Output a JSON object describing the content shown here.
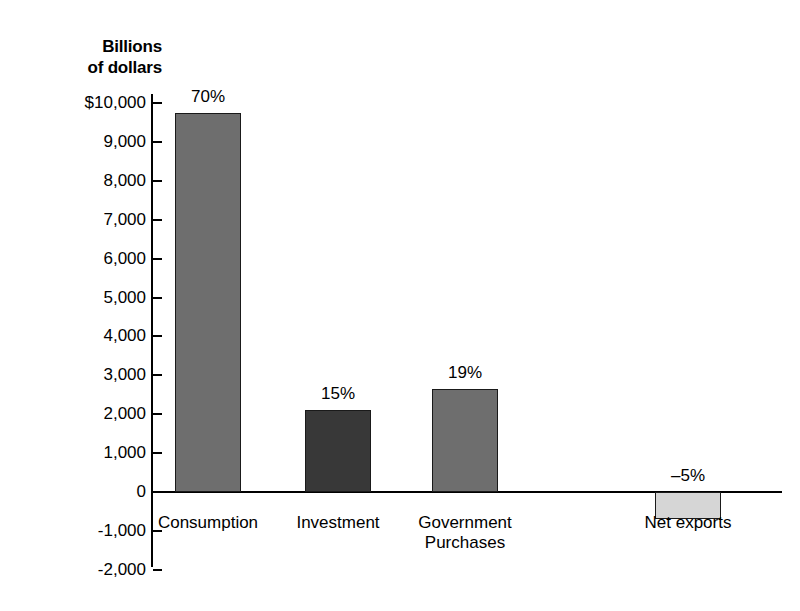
{
  "chart_data": {
    "type": "bar",
    "title": "",
    "subtitle": "",
    "axis_title": "Billions\nof dollars",
    "xlabel": "",
    "ylabel": "Billions of dollars",
    "ylim": [
      -2000,
      10000
    ],
    "ytick_step": 1000,
    "grid": false,
    "legend": "none",
    "categories": [
      "Consumption",
      "Investment",
      "Government\nPurchases",
      "Net exports"
    ],
    "values": [
      9750,
      2100,
      2650,
      -700
    ],
    "data_labels": [
      "70%",
      "15%",
      "19%",
      "–5%"
    ],
    "bar_colors": [
      "#6e6e6e",
      "#383838",
      "#6e6e6e",
      "#d6d6d6"
    ],
    "ytick_labels": [
      "$10,000",
      "9,000",
      "8,000",
      "7,000",
      "6,000",
      "5,000",
      "4,000",
      "3,000",
      "2,000",
      "1,000",
      "0",
      "-1,000",
      "-2,000"
    ],
    "ytick_values": [
      10000,
      9000,
      8000,
      7000,
      6000,
      5000,
      4000,
      3000,
      2000,
      1000,
      0,
      -1000,
      -2000
    ],
    "series": [
      {
        "name": "Components of GDP",
        "points": [
          {
            "category": "Consumption",
            "value": 9750,
            "label": "70%",
            "color": "#6e6e6e"
          },
          {
            "category": "Investment",
            "value": 2100,
            "label": "15%",
            "color": "#383838"
          },
          {
            "category": "Government Purchases",
            "value": 2650,
            "label": "19%",
            "color": "#6e6e6e"
          },
          {
            "category": "Net exports",
            "value": -700,
            "label": "–5%",
            "color": "#d6d6d6"
          }
        ]
      }
    ],
    "colors": {
      "axis": "#000000",
      "background": "#ffffff",
      "bar_outline": "#1a1a1a"
    }
  }
}
